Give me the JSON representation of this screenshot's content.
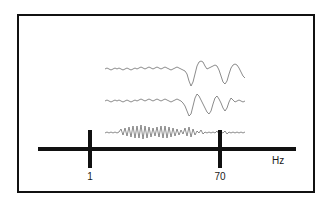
{
  "figure": {
    "title": "",
    "frame": {
      "border_color": "#111111"
    },
    "background_color": "#ffffff"
  },
  "axis": {
    "name": "frequency-axis",
    "unit_label": "Hz",
    "color": "#111111",
    "ticks": [
      {
        "label": "1",
        "value": 1
      },
      {
        "label": "70",
        "value": 70
      }
    ]
  },
  "traces": {
    "stroke_color": "#5a5a5a",
    "items": [
      {
        "name": "eeg-trace-top",
        "label": ""
      },
      {
        "name": "eeg-trace-middle",
        "label": ""
      },
      {
        "name": "hfo-trace-bottom",
        "label": ""
      }
    ]
  },
  "chart_data": {
    "type": "line",
    "title": "",
    "xlabel": "Hz",
    "ylabel": "",
    "grid": false,
    "legend": "none",
    "axis_ticks": [
      1,
      70
    ],
    "axis_tick_labels": [
      "1",
      "70"
    ],
    "xlim": [
      0,
      100
    ],
    "series": [
      {
        "name": "eeg-trace-top",
        "x": [
          0,
          2,
          4,
          6,
          8,
          10,
          12,
          14,
          16,
          18,
          20,
          22,
          24,
          26,
          28,
          30,
          32,
          34,
          36,
          38,
          40,
          42,
          44,
          46,
          48,
          50,
          52,
          54,
          56,
          58,
          60,
          62,
          64,
          66,
          68,
          70,
          72,
          74,
          76,
          78,
          80,
          82,
          84,
          86,
          88,
          90,
          92,
          94,
          96,
          98,
          100,
          102,
          104,
          106,
          108,
          110,
          112,
          114,
          116,
          118,
          120,
          122,
          124,
          126,
          128,
          130,
          132,
          134,
          136,
          138,
          140
        ],
        "y": [
          13,
          12,
          13,
          14,
          13,
          12,
          13,
          12,
          13,
          14,
          13,
          12,
          13,
          14,
          13,
          12,
          13,
          12,
          11,
          12,
          13,
          12,
          11,
          12,
          13,
          12,
          11,
          12,
          13,
          12,
          11,
          12,
          13,
          14,
          13,
          12,
          11,
          12,
          13,
          14,
          15,
          18,
          25,
          30,
          26,
          18,
          10,
          6,
          5,
          6,
          10,
          13,
          12,
          11,
          10,
          9,
          10,
          14,
          20,
          26,
          28,
          25,
          18,
          12,
          9,
          8,
          9,
          12,
          16,
          20,
          22
        ]
      },
      {
        "name": "eeg-trace-middle",
        "x": [
          0,
          2,
          4,
          6,
          8,
          10,
          12,
          14,
          16,
          18,
          20,
          22,
          24,
          26,
          28,
          30,
          32,
          34,
          36,
          38,
          40,
          42,
          44,
          46,
          48,
          50,
          52,
          54,
          56,
          58,
          60,
          62,
          64,
          66,
          68,
          70,
          72,
          74,
          76,
          78,
          80,
          82,
          84,
          86,
          88,
          90,
          92,
          94,
          96,
          98,
          100,
          102,
          104,
          106,
          108,
          110,
          112,
          114,
          116,
          118,
          120,
          122,
          124,
          126,
          128,
          130,
          132,
          134,
          136,
          138,
          140
        ],
        "y": [
          45,
          44,
          45,
          46,
          45,
          44,
          45,
          44,
          45,
          46,
          45,
          44,
          45,
          46,
          45,
          44,
          45,
          44,
          43,
          44,
          45,
          44,
          43,
          44,
          45,
          44,
          43,
          44,
          45,
          44,
          43,
          44,
          45,
          46,
          45,
          44,
          43,
          44,
          45,
          47,
          50,
          55,
          60,
          58,
          50,
          42,
          38,
          40,
          44,
          48,
          52,
          56,
          58,
          55,
          48,
          42,
          40,
          43,
          47,
          52,
          55,
          52,
          46,
          42,
          44,
          46,
          45,
          44,
          45,
          46,
          45
        ]
      },
      {
        "name": "hfo-trace-bottom",
        "x": [
          0,
          2,
          4,
          6,
          8,
          10,
          12,
          14,
          16,
          18,
          20,
          22,
          24,
          26,
          28,
          30,
          32,
          34,
          36,
          38,
          40,
          42,
          44,
          46,
          48,
          50,
          52,
          54,
          56,
          58,
          60,
          62,
          64,
          66,
          68,
          70,
          72,
          74,
          76,
          78,
          80,
          82,
          84,
          86,
          88,
          90,
          92,
          94,
          96,
          98,
          100,
          102,
          104,
          106,
          108,
          110,
          112,
          114,
          116,
          118,
          120,
          122,
          124,
          126,
          128,
          130,
          132,
          134,
          136,
          138,
          140
        ],
        "y": [
          77,
          76,
          77,
          76,
          77,
          76,
          77,
          76,
          73,
          79,
          72,
          80,
          71,
          81,
          70,
          82,
          70,
          82,
          69,
          83,
          70,
          82,
          71,
          81,
          72,
          80,
          71,
          81,
          70,
          82,
          70,
          82,
          71,
          81,
          72,
          80,
          73,
          79,
          74,
          78,
          72,
          80,
          71,
          81,
          73,
          79,
          75,
          77,
          74,
          78,
          76,
          77,
          76,
          77,
          76,
          77,
          75,
          78,
          76,
          77,
          75,
          78,
          76,
          77,
          76,
          77,
          76,
          77,
          76,
          77,
          76
        ]
      }
    ]
  }
}
